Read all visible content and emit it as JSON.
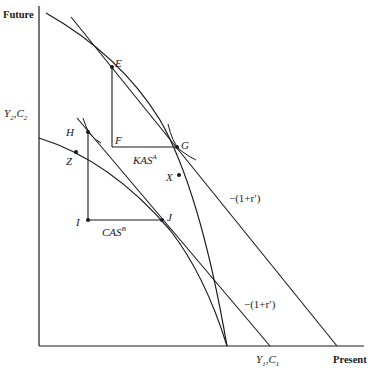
{
  "diagram": {
    "type": "intertemporal-trade-ppf",
    "axes": {
      "y_axis_title": "Future",
      "y_axis_label": "Y2,C2",
      "x_axis_title": "Present",
      "x_axis_label": "Y1,C1"
    },
    "points": {
      "E": "E",
      "F": "F",
      "G": "G",
      "H": "H",
      "I": "I",
      "J": "J",
      "X": "X",
      "Z": "Z"
    },
    "segment_labels": {
      "kas": "KAS",
      "kas_sup": "A",
      "cas": "CAS",
      "cas_sup": "B"
    },
    "slope_labels": {
      "upper": "−(1+r′)",
      "lower": "−(1+r′)"
    },
    "colors": {
      "line": "#1a1a1a",
      "background": "#ffffff"
    }
  }
}
